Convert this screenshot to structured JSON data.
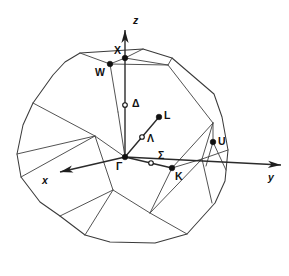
{
  "figure": {
    "name": "first-brillouin-zone-fcc",
    "background_color": "#ffffff",
    "line_color": "#3a3a3a",
    "label_color": "#111111",
    "width": 289,
    "height": 276
  },
  "axes": [
    {
      "id": "z",
      "label": "z",
      "label_x": 133,
      "label_y": 24,
      "x1": 125,
      "y1": 157,
      "x2": 125,
      "y2": 30,
      "head": "up"
    },
    {
      "id": "y",
      "label": "y",
      "label_x": 268,
      "label_y": 181,
      "x1": 125,
      "y1": 157,
      "x2": 281,
      "y2": 165,
      "head": "right-down"
    },
    {
      "id": "x",
      "label": "x",
      "label_x": 42,
      "label_y": 184,
      "x1": 125,
      "y1": 157,
      "x2": 60,
      "y2": 172,
      "head": "left-down"
    }
  ],
  "symmetry_lines": [
    {
      "id": "lambda",
      "from": "gamma",
      "x1": 125,
      "y1": 157,
      "x2": 159,
      "y2": 117
    },
    {
      "id": "sigma",
      "from": "gamma",
      "x1": 125,
      "y1": 157,
      "x2": 172,
      "y2": 168
    }
  ],
  "points": [
    {
      "id": "gamma",
      "label": "Γ",
      "marker": "filled",
      "x": 125,
      "y": 157,
      "label_x": 116,
      "label_y": 170
    },
    {
      "id": "x",
      "label": "X",
      "marker": "filled",
      "x": 125,
      "y": 58,
      "label_x": 114,
      "label_y": 54
    },
    {
      "id": "w",
      "label": "W",
      "marker": "filled",
      "x": 110,
      "y": 64,
      "label_x": 95,
      "label_y": 76
    },
    {
      "id": "delta",
      "label": "Δ",
      "marker": "open",
      "x": 125,
      "y": 105,
      "label_x": 132,
      "label_y": 107
    },
    {
      "id": "l",
      "label": "L",
      "marker": "filled",
      "x": 159,
      "y": 117,
      "label_x": 164,
      "label_y": 119
    },
    {
      "id": "lambda",
      "label": "Λ",
      "marker": "open",
      "x": 142,
      "y": 137,
      "label_x": 147,
      "label_y": 142
    },
    {
      "id": "sigma",
      "label": "Σ",
      "marker": "open",
      "x": 151,
      "y": 163,
      "label_x": 158,
      "label_y": 159
    },
    {
      "id": "k",
      "label": "K",
      "marker": "filled",
      "x": 172,
      "y": 168,
      "label_x": 175,
      "label_y": 180
    },
    {
      "id": "u",
      "label": "U",
      "marker": "filled",
      "x": 213,
      "y": 142,
      "label_x": 218,
      "label_y": 145
    }
  ],
  "silhouette": [
    [
      80,
      53
    ],
    [
      143,
      49
    ],
    [
      172,
      58
    ],
    [
      214,
      94
    ],
    [
      222,
      117
    ],
    [
      228,
      150
    ],
    [
      225,
      181
    ],
    [
      215,
      203
    ],
    [
      187,
      234
    ],
    [
      155,
      243
    ],
    [
      110,
      242
    ],
    [
      85,
      235
    ],
    [
      60,
      216
    ],
    [
      40,
      202
    ],
    [
      21,
      177
    ],
    [
      17,
      154
    ],
    [
      23,
      125
    ],
    [
      33,
      103
    ],
    [
      53,
      75
    ],
    [
      65,
      62
    ]
  ],
  "interior_edges": [
    [
      [
        80,
        53
      ],
      [
        110,
        64
      ],
      [
        168,
        65
      ],
      [
        172,
        58
      ]
    ],
    [
      [
        110,
        64
      ],
      [
        125,
        58
      ],
      [
        143,
        49
      ]
    ],
    [
      [
        125,
        58
      ],
      [
        168,
        65
      ]
    ],
    [
      [
        110,
        64
      ],
      [
        118,
        112
      ]
    ],
    [
      [
        168,
        65
      ],
      [
        213,
        123
      ]
    ],
    [
      [
        33,
        103
      ],
      [
        95,
        136
      ],
      [
        113,
        190
      ],
      [
        85,
        235
      ]
    ],
    [
      [
        95,
        136
      ],
      [
        125,
        157
      ]
    ],
    [
      [
        118,
        112
      ],
      [
        125,
        157
      ]
    ],
    [
      [
        113,
        190
      ],
      [
        150,
        213
      ],
      [
        187,
        234
      ]
    ],
    [
      [
        150,
        213
      ],
      [
        172,
        168
      ]
    ],
    [
      [
        172,
        168
      ],
      [
        213,
        123
      ]
    ],
    [
      [
        213,
        123
      ],
      [
        213,
        142
      ],
      [
        226,
        170
      ]
    ],
    [
      [
        213,
        123
      ],
      [
        202,
        159
      ],
      [
        212,
        203
      ]
    ],
    [
      [
        213,
        142
      ],
      [
        206,
        166
      ]
    ],
    [
      [
        202,
        159
      ],
      [
        228,
        150
      ]
    ],
    [
      [
        172,
        168
      ],
      [
        202,
        159
      ]
    ],
    [
      [
        150,
        213
      ],
      [
        202,
        159
      ]
    ],
    [
      [
        21,
        177
      ],
      [
        95,
        136
      ]
    ],
    [
      [
        17,
        154
      ],
      [
        95,
        136
      ]
    ],
    [
      [
        60,
        216
      ],
      [
        113,
        190
      ]
    ]
  ],
  "caption": {
    "point_labels": [
      "Γ",
      "X",
      "W",
      "L",
      "K",
      "U",
      "Δ",
      "Λ",
      "Σ"
    ],
    "axis_labels": [
      "x",
      "y",
      "z"
    ]
  }
}
